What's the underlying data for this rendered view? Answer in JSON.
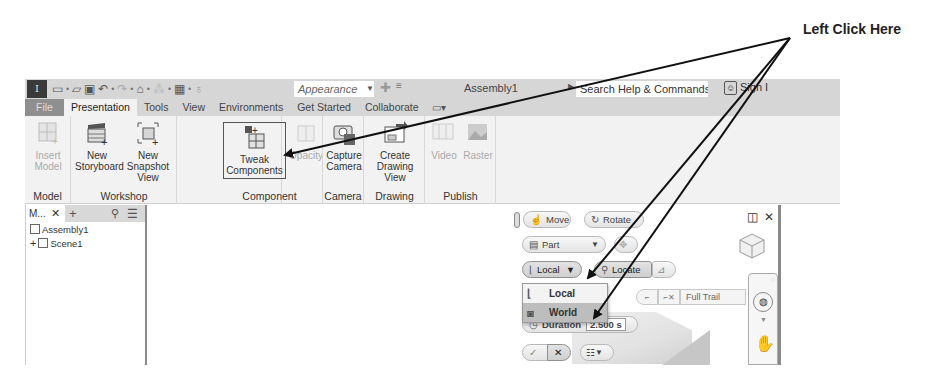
{
  "annotation": {
    "text": "Left Click Here"
  },
  "titlebar": {
    "app_logo": "I",
    "quick_access_icons": [
      "new-icon",
      "open-icon",
      "save-icon",
      "undo-icon",
      "redo-icon",
      "home-icon",
      "update-icon",
      "material-icon",
      "appearance-icon"
    ],
    "appearance_value": "Appearance",
    "document_title": "Assembly1",
    "search_placeholder": "Search Help & Commands...",
    "sign_in": "Sign I"
  },
  "tabs": [
    {
      "label": "File"
    },
    {
      "label": "Presentation",
      "active": true
    },
    {
      "label": "Tools"
    },
    {
      "label": "View"
    },
    {
      "label": "Environments"
    },
    {
      "label": "Get Started"
    },
    {
      "label": "Collaborate"
    }
  ],
  "ribbon": {
    "panels": [
      {
        "title": "Model",
        "buttons": [
          {
            "line1": "Insert Model",
            "line2": "",
            "disabled": true
          }
        ]
      },
      {
        "title": "Workshop",
        "buttons": [
          {
            "line1": "New",
            "line2": "Storyboard"
          },
          {
            "line1": "New",
            "line2": "Snapshot View"
          }
        ]
      },
      {
        "title": "Component",
        "buttons": [
          {
            "line1": "Tweak",
            "line2": "Components",
            "highlight": true
          },
          {
            "line1": "Opacity",
            "line2": "",
            "disabled": true
          }
        ]
      },
      {
        "title": "Camera",
        "buttons": [
          {
            "line1": "Capture",
            "line2": "Camera"
          }
        ]
      },
      {
        "title": "Drawing",
        "buttons": [
          {
            "line1": "Create",
            "line2": "Drawing View"
          }
        ]
      },
      {
        "title": "Publish",
        "buttons": [
          {
            "line1": "Video",
            "line2": "",
            "disabled": true
          },
          {
            "line1": "Raster",
            "line2": "",
            "disabled": true
          }
        ]
      }
    ]
  },
  "browser": {
    "title": "M...",
    "tree": [
      {
        "label": "Assembly1",
        "expander": ""
      },
      {
        "label": "Scene1",
        "expander": "+"
      }
    ]
  },
  "minitoolbar": {
    "move": "Move",
    "rotate": "Rotate",
    "part": "Part",
    "local": "Local",
    "locate": "Locate",
    "full_trail": "Full Trail",
    "duration_label": "Duration",
    "duration_value": "2.500 s"
  },
  "dropdown": {
    "items": [
      {
        "label": "Local",
        "selected": false
      },
      {
        "label": "World",
        "selected": true
      }
    ]
  }
}
